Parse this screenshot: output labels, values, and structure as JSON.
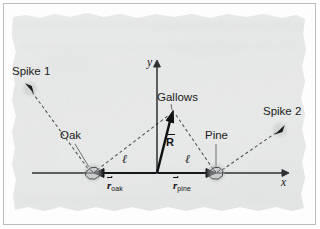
{
  "figure": {
    "kind": "vector-diagram",
    "medium": "aged torn parchment map",
    "background_color": "#e9eaea",
    "ink_color": "#1b1b1b",
    "frame_color": "#b9bcbe"
  },
  "axes": {
    "x_label": "x",
    "y_label": "y",
    "origin": {
      "x": 157,
      "y": 173
    },
    "x_axis": {
      "x1": 32,
      "y1": 173,
      "x2": 286,
      "y2": 173
    },
    "y_axis": {
      "x1": 157,
      "y1": 173,
      "x2": 157,
      "y2": 63
    }
  },
  "landmarks": [
    {
      "id": "oak",
      "label": "Oak",
      "label_pos": {
        "x": 61,
        "y": 135
      },
      "marker": {
        "x": 93,
        "y": 173
      },
      "marker_kind": "tree-canopy-marker"
    },
    {
      "id": "pine",
      "label": "Pine",
      "label_pos": {
        "x": 205,
        "y": 135
      },
      "marker": {
        "x": 216,
        "y": 173
      },
      "marker_kind": "tree-canopy-marker"
    },
    {
      "id": "gallows",
      "label": "Gallows",
      "label_pos": {
        "x": 157,
        "y": 97
      },
      "marker": {
        "x": 173,
        "y": 112
      },
      "marker_kind": "arrow-tip"
    },
    {
      "id": "spike1",
      "label": "Spike 1",
      "label_pos": {
        "x": 12,
        "y": 68
      },
      "marker": {
        "x": 29,
        "y": 88
      },
      "marker_kind": "spike-arrowhead"
    },
    {
      "id": "spike2",
      "label": "Spike 2",
      "label_pos": {
        "x": 264,
        "y": 108
      },
      "marker": {
        "x": 280,
        "y": 129
      },
      "marker_kind": "spike-arrowhead"
    }
  ],
  "vectors": [
    {
      "id": "R",
      "symbol": "R",
      "subscript": "",
      "style": "solid-bold-arrow",
      "from": {
        "x": 157,
        "y": 173
      },
      "to": {
        "x": 172,
        "y": 113
      },
      "label_pos": {
        "x": 168,
        "y": 136
      }
    },
    {
      "id": "r_oak",
      "symbol": "r",
      "subscript": "oak",
      "style": "solid-arrow",
      "from": {
        "x": 157,
        "y": 173
      },
      "to": {
        "x": 95,
        "y": 173
      },
      "label_pos": {
        "x": 110,
        "y": 181
      }
    },
    {
      "id": "r_pine",
      "symbol": "r",
      "subscript": "pine",
      "style": "solid-arrow",
      "from": {
        "x": 157,
        "y": 173
      },
      "to": {
        "x": 214,
        "y": 173
      },
      "label_pos": {
        "x": 176,
        "y": 181
      }
    }
  ],
  "dashed_paths": [
    {
      "id": "spike1-to-oak",
      "from": {
        "x": 32,
        "y": 92
      },
      "to": {
        "x": 89,
        "y": 170
      }
    },
    {
      "id": "oak-to-gallows",
      "from": {
        "x": 97,
        "y": 170
      },
      "to": {
        "x": 169,
        "y": 114
      }
    },
    {
      "id": "gallows-to-pine",
      "from": {
        "x": 176,
        "y": 114
      },
      "to": {
        "x": 214,
        "y": 169
      }
    },
    {
      "id": "pine-to-spike2",
      "from": {
        "x": 221,
        "y": 170
      },
      "to": {
        "x": 277,
        "y": 132
      }
    },
    {
      "id": "oak-stem",
      "from": {
        "x": 74,
        "y": 141
      },
      "to": {
        "x": 88,
        "y": 166
      }
    },
    {
      "id": "pine-stem",
      "from": {
        "x": 216,
        "y": 141
      },
      "to": {
        "x": 216,
        "y": 166
      }
    }
  ],
  "distance_labels": [
    {
      "id": "ell-left",
      "text": "ℓ",
      "pos": {
        "x": 123,
        "y": 159
      }
    },
    {
      "id": "ell-right",
      "text": "ℓ",
      "pos": {
        "x": 186,
        "y": 159
      }
    }
  ],
  "leader_lines": [
    {
      "id": "oak-leader",
      "from": {
        "x": 74,
        "y": 146
      },
      "to": {
        "x": 89,
        "y": 167
      }
    },
    {
      "id": "pine-leader",
      "from": {
        "x": 216,
        "y": 144
      },
      "to": {
        "x": 216,
        "y": 167
      }
    }
  ]
}
